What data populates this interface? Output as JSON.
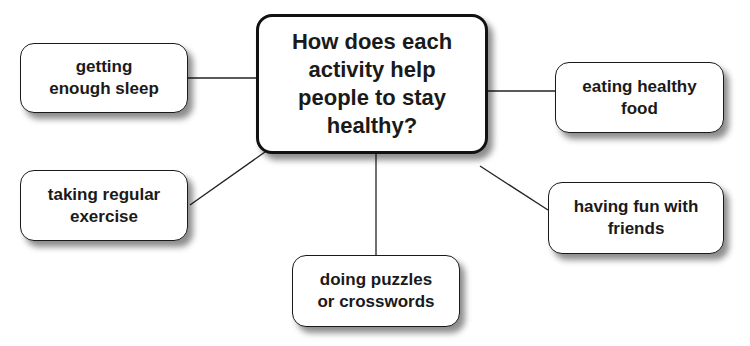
{
  "diagram": {
    "type": "mind-map",
    "central_question": [
      "How does each",
      "activity help",
      "people to stay",
      "healthy?"
    ],
    "nodes": [
      {
        "id": "sleep",
        "lines": [
          "getting",
          "enough sleep"
        ]
      },
      {
        "id": "exercise",
        "lines": [
          "taking regular",
          "exercise"
        ]
      },
      {
        "id": "puzzles",
        "lines": [
          "doing puzzles",
          "or crosswords"
        ]
      },
      {
        "id": "food",
        "lines": [
          "eating healthy",
          "food"
        ]
      },
      {
        "id": "friends",
        "lines": [
          "having fun with",
          "friends"
        ]
      }
    ],
    "colors": {
      "stroke": "#1a1a1a",
      "background": "#ffffff"
    }
  }
}
